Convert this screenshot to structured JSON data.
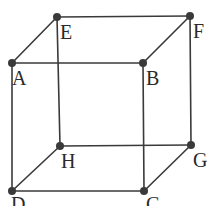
{
  "figure": {
    "type": "geometric-line-diagram",
    "shape": "cube",
    "background_color": "#ffffff",
    "edge_color": "#3a3a3a",
    "edge_width": 1.6,
    "vertex_color": "#3a3a3a",
    "vertex_radius": 4,
    "label_color": "#2a2a2a",
    "label_font_size": 20
  },
  "chart_data": {
    "type": "scatter",
    "title": "",
    "xlabel": "",
    "ylabel": "",
    "grid": false,
    "legend": false,
    "vertices": [
      {
        "id": "A",
        "label": "A",
        "x": 12,
        "y": 63,
        "label_x": 12,
        "label_y": 68,
        "role": "front-top-left"
      },
      {
        "id": "B",
        "label": "B",
        "x": 143,
        "y": 63,
        "label_x": 146,
        "label_y": 68,
        "role": "front-top-right"
      },
      {
        "id": "C",
        "label": "C",
        "x": 144,
        "y": 191,
        "label_x": 146,
        "label_y": 194,
        "role": "front-bottom-right"
      },
      {
        "id": "D",
        "label": "D",
        "x": 12,
        "y": 191,
        "label_x": 11,
        "label_y": 194,
        "role": "front-bottom-left"
      },
      {
        "id": "E",
        "label": "E",
        "x": 57,
        "y": 17,
        "label_x": 60,
        "label_y": 22,
        "role": "back-top-left"
      },
      {
        "id": "F",
        "label": "F",
        "x": 190,
        "y": 16,
        "label_x": 193,
        "label_y": 21,
        "role": "back-top-right"
      },
      {
        "id": "G",
        "label": "G",
        "x": 191,
        "y": 145,
        "label_x": 193,
        "label_y": 150,
        "role": "back-bottom-right"
      },
      {
        "id": "H",
        "label": "H",
        "x": 60,
        "y": 146,
        "label_x": 61,
        "label_y": 151,
        "role": "back-bottom-left"
      }
    ],
    "edges": [
      {
        "from": "A",
        "to": "B",
        "style": "solid"
      },
      {
        "from": "B",
        "to": "C",
        "style": "solid"
      },
      {
        "from": "C",
        "to": "D",
        "style": "solid"
      },
      {
        "from": "D",
        "to": "A",
        "style": "solid"
      },
      {
        "from": "E",
        "to": "F",
        "style": "solid"
      },
      {
        "from": "F",
        "to": "G",
        "style": "solid"
      },
      {
        "from": "G",
        "to": "H",
        "style": "solid"
      },
      {
        "from": "H",
        "to": "E",
        "style": "solid"
      },
      {
        "from": "A",
        "to": "E",
        "style": "solid"
      },
      {
        "from": "B",
        "to": "F",
        "style": "solid"
      },
      {
        "from": "C",
        "to": "G",
        "style": "solid"
      },
      {
        "from": "D",
        "to": "H",
        "style": "solid"
      }
    ]
  }
}
